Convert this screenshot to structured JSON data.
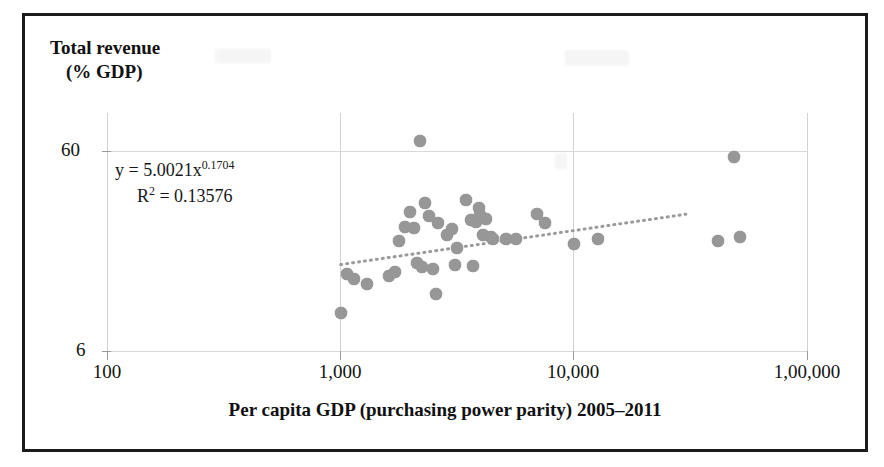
{
  "figure": {
    "ytitle_line1": "Total revenue",
    "ytitle_line2": "(% GDP)",
    "xtitle": "Per capita GDP (purchasing power parity) 2005–2011",
    "equation_prefix": "y = 5.0021x",
    "equation_exponent": "0.1704",
    "r2_prefix": "R",
    "r2_sup": "2",
    "r2_value": " = 0.13576",
    "marker_color": "#7e7e7e",
    "trendline_color": "#9a9a9a",
    "frame_color": "#1b1b1b",
    "grid_color": "#d2d2d2"
  },
  "chart_data": {
    "type": "scatter",
    "title": "",
    "xlabel": "Per capita GDP (purchasing power parity) 2005–2011",
    "ylabel": "Total revenue (% GDP)",
    "xscale": "log",
    "yscale": "log",
    "xlim": [
      100,
      100000
    ],
    "ylim": [
      6,
      72
    ],
    "xticks": [
      100,
      1000,
      10000,
      100000
    ],
    "xticklabels": [
      "100",
      "1,000",
      "10,000",
      "1,00,000"
    ],
    "yticks": [
      6,
      60
    ],
    "yticklabels": [
      "6",
      "60"
    ],
    "grid": true,
    "legend": null,
    "annotations": [
      {
        "text": "y = 5.0021x^0.1704",
        "x": 1100,
        "y": 48
      },
      {
        "text": "R² = 0.13576",
        "x": 1100,
        "y": 42
      }
    ],
    "trend": {
      "type": "power",
      "equation": "y = 5.0021x^0.1704",
      "coefficient": 5.0021,
      "exponent": 0.1704,
      "r_squared": 0.13576,
      "style": "dotted",
      "x_start": 1000,
      "x_end": 30000
    },
    "series": [
      {
        "name": "Countries",
        "points": [
          [
            1000,
            9.3
          ],
          [
            1060,
            14.6
          ],
          [
            1140,
            13.8
          ],
          [
            1300,
            13.0
          ],
          [
            1610,
            14.3
          ],
          [
            1700,
            14.9
          ],
          [
            1770,
            21.2
          ],
          [
            1880,
            25.0
          ],
          [
            1980,
            29.9
          ],
          [
            2060,
            24.6
          ],
          [
            2130,
            16.6
          ],
          [
            2180,
            67.0
          ],
          [
            2230,
            15.8
          ],
          [
            2300,
            33.1
          ],
          [
            2390,
            28.5
          ],
          [
            2480,
            15.4
          ],
          [
            2560,
            11.6
          ],
          [
            2620,
            26.3
          ],
          [
            2860,
            22.7
          ],
          [
            3000,
            24.4
          ],
          [
            3080,
            16.1
          ],
          [
            3140,
            19.7
          ],
          [
            3420,
            34.0
          ],
          [
            3600,
            27.2
          ],
          [
            3700,
            16.0
          ],
          [
            3780,
            26.4
          ],
          [
            3900,
            31.0
          ],
          [
            3950,
            28.6
          ],
          [
            4080,
            22.9
          ],
          [
            4180,
            27.3
          ],
          [
            4400,
            22.3
          ],
          [
            4500,
            21.8
          ],
          [
            5100,
            21.9
          ],
          [
            5600,
            21.8
          ],
          [
            6900,
            29.2
          ],
          [
            7500,
            26.1
          ],
          [
            10000,
            20.6
          ],
          [
            12600,
            21.9
          ],
          [
            41000,
            21.3
          ],
          [
            48000,
            56.0
          ],
          [
            51000,
            22.4
          ]
        ]
      }
    ]
  }
}
